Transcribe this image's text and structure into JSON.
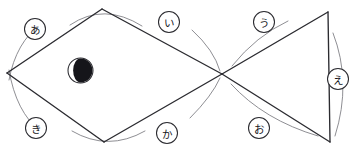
{
  "figure": {
    "background_color": "#ffffff",
    "line_color": "#2b2b30",
    "arc_color": "#7a7a80",
    "width": 358,
    "height": 159
  },
  "markers": [
    {
      "name": "moon-marker",
      "glyph": "waning-crescent",
      "cx": 80.5,
      "cy": 70.5,
      "r": 12.5,
      "fill_color": "#15151a",
      "ring_color": "#2b2b30"
    }
  ],
  "vertices": [
    {
      "id": "left",
      "label": "",
      "x": 7,
      "y": 73
    },
    {
      "id": "top-left",
      "label": "",
      "x": 102,
      "y": 9
    },
    {
      "id": "center",
      "label": "",
      "x": 222,
      "y": 74
    },
    {
      "id": "bottom-left",
      "label": "",
      "x": 104,
      "y": 142
    },
    {
      "id": "top-right",
      "label": "",
      "x": 328,
      "y": 12
    },
    {
      "id": "bottom-right",
      "label": "",
      "x": 330,
      "y": 142
    }
  ],
  "edges": [
    {
      "name": "edge-left-to-topleft",
      "d": "M 7 73 L 102 9"
    },
    {
      "name": "edge-topleft-to-center",
      "d": "M 102 9 L 222 74"
    },
    {
      "name": "edge-center-to-bottomleft",
      "d": "M 222 74 L 104 142"
    },
    {
      "name": "edge-bottomleft-to-left",
      "d": "M 104 142 L 7 73"
    },
    {
      "name": "edge-center-to-topright",
      "d": "M 222 74 L 328 12"
    },
    {
      "name": "edge-topright-to-bottomright",
      "d": "M 328 12 L 330 142"
    },
    {
      "name": "edge-bottomright-to-center",
      "d": "M 330 142 L 222 74"
    }
  ],
  "arcs": [
    {
      "name": "arc-a",
      "d": "M 41 24 Q 16 42 9 80"
    },
    {
      "name": "arc-i",
      "d": "M 70 25 Q 104 2 142 26"
    },
    {
      "name": "arc-u",
      "d": "M 288 21 Q 256 36 232 66"
    },
    {
      "name": "arc-e",
      "d": "M 333 33 Q 352 82 335 136"
    },
    {
      "name": "arc-ki",
      "d": "M 9 70 Q 16 112 40 131"
    },
    {
      "name": "arc-ka",
      "d": "M 72 131 Q 108 152 145 131"
    },
    {
      "name": "arc-o",
      "d": "M 231 84 Q 264 120 318 136"
    },
    {
      "name": "arc-center-upper",
      "d": "M 192 30 Q 214 50 220 71"
    },
    {
      "name": "arc-center-lower",
      "d": "M 190 118 Q 212 96 220 78"
    }
  ],
  "labels": [
    {
      "name": "label-a",
      "text": "あ",
      "cx": 35,
      "cy": 29,
      "r": 10.5
    },
    {
      "name": "label-i",
      "text": "い",
      "cx": 169,
      "cy": 22,
      "r": 10.5
    },
    {
      "name": "label-u",
      "text": "う",
      "cx": 264,
      "cy": 22,
      "r": 10.5
    },
    {
      "name": "label-e",
      "text": "え",
      "cx": 338,
      "cy": 79,
      "r": 10.5
    },
    {
      "name": "label-ki",
      "text": "き",
      "cx": 36,
      "cy": 128,
      "r": 10.5
    },
    {
      "name": "label-ka",
      "text": "か",
      "cx": 167,
      "cy": 133,
      "r": 10.5
    },
    {
      "name": "label-o",
      "text": "お",
      "cx": 259,
      "cy": 128,
      "r": 10.5
    }
  ]
}
